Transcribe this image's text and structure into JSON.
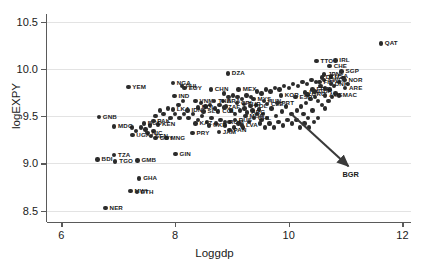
{
  "chart_data": {
    "type": "scatter",
    "title": "",
    "xlabel": "Loggdp",
    "ylabel": "logEXPY",
    "xlim": [
      5.75,
      12.15
    ],
    "ylim": [
      8.38,
      10.58
    ],
    "xticks": [
      "6",
      "8",
      "10",
      "12"
    ],
    "xtick_values": [
      6,
      8,
      10,
      12
    ],
    "yticks": [
      "8.5",
      "9.0",
      "9.5",
      "10.0",
      "10.5"
    ],
    "ytick_values": [
      8.5,
      9.0,
      9.5,
      10.0,
      10.5
    ],
    "grid": "horizontal",
    "legend": "none",
    "marker_color": "#2b2b2b",
    "grid_color": "#e3e3e3",
    "axis_color": "#5a5a5a",
    "annotation": {
      "label": "BGR",
      "arrow_from_x": 10.05,
      "arrow_from_y": 9.52,
      "arrow_to_x": 11.05,
      "arrow_to_y": 8.97
    },
    "points": [
      {
        "label": "QAT",
        "x": 11.62,
        "y": 10.27,
        "lpos": "right"
      },
      {
        "label": "TTO",
        "x": 10.49,
        "y": 10.08,
        "lpos": "right"
      },
      {
        "label": "IRL",
        "x": 10.82,
        "y": 10.09,
        "lpos": "right"
      },
      {
        "label": "CHE",
        "x": 10.72,
        "y": 10.03,
        "lpos": "right"
      },
      {
        "label": "SGP",
        "x": 10.93,
        "y": 9.97,
        "lpos": "right"
      },
      {
        "label": "DZA",
        "x": 8.93,
        "y": 9.95,
        "lpos": "right"
      },
      {
        "label": "NGA",
        "x": 7.96,
        "y": 9.85,
        "lpos": "right"
      },
      {
        "label": "YEM",
        "x": 7.18,
        "y": 9.81,
        "lpos": "right"
      },
      {
        "label": "JPN",
        "x": 10.62,
        "y": 9.94,
        "lpos": "right"
      },
      {
        "label": "USA",
        "x": 10.74,
        "y": 9.92,
        "lpos": "right"
      },
      {
        "label": "DEU",
        "x": 10.58,
        "y": 9.91,
        "lpos": "right"
      },
      {
        "label": "NOR",
        "x": 10.98,
        "y": 9.88,
        "lpos": "right"
      },
      {
        "label": "SWE",
        "x": 10.62,
        "y": 9.88,
        "lpos": "right"
      },
      {
        "label": "FIN",
        "x": 10.54,
        "y": 9.86,
        "lpos": "right"
      },
      {
        "label": "DNK",
        "x": 10.74,
        "y": 9.84,
        "lpos": "right"
      },
      {
        "label": "ARE",
        "x": 10.99,
        "y": 9.8,
        "lpos": "right"
      },
      {
        "label": "MAC",
        "x": 10.88,
        "y": 9.72,
        "lpos": "right"
      },
      {
        "label": "GRC",
        "x": 10.33,
        "y": 9.73,
        "lpos": "right"
      },
      {
        "label": "AUS",
        "x": 10.64,
        "y": 9.72,
        "lpos": "right"
      },
      {
        "label": "EGY",
        "x": 8.17,
        "y": 9.8,
        "lpos": "right"
      },
      {
        "label": "PHL",
        "x": 8.12,
        "y": 9.82,
        "lpos": "right"
      },
      {
        "label": "CHN",
        "x": 8.63,
        "y": 9.78,
        "lpos": "right"
      },
      {
        "label": "MEX",
        "x": 9.12,
        "y": 9.78,
        "lpos": "right"
      },
      {
        "label": "IND",
        "x": 7.99,
        "y": 9.71,
        "lpos": "right"
      },
      {
        "label": "VNM",
        "x": 8.36,
        "y": 9.66,
        "lpos": "right"
      },
      {
        "label": "BOL",
        "x": 8.4,
        "y": 9.59,
        "lpos": "right"
      },
      {
        "label": "BRA",
        "x": 8.84,
        "y": 9.66,
        "lpos": "right"
      },
      {
        "label": "THA",
        "x": 8.69,
        "y": 9.66,
        "lpos": "right"
      },
      {
        "label": "TUR",
        "x": 9.21,
        "y": 9.63,
        "lpos": "right"
      },
      {
        "label": "CRI",
        "x": 9.09,
        "y": 9.64,
        "lpos": "right"
      },
      {
        "label": "COL",
        "x": 8.76,
        "y": 9.55,
        "lpos": "right"
      },
      {
        "label": "ARG",
        "x": 9.27,
        "y": 9.54,
        "lpos": "right"
      },
      {
        "label": "MYS",
        "x": 9.38,
        "y": 9.68,
        "lpos": "right"
      },
      {
        "label": "ZAF",
        "x": 8.86,
        "y": 9.59,
        "lpos": "right"
      },
      {
        "label": "POL",
        "x": 9.33,
        "y": 9.61,
        "lpos": "right"
      },
      {
        "label": "HUN",
        "x": 9.56,
        "y": 9.66,
        "lpos": "right"
      },
      {
        "label": "CZE",
        "x": 9.62,
        "y": 9.63,
        "lpos": "right"
      },
      {
        "label": "KOR",
        "x": 9.86,
        "y": 9.72,
        "lpos": "right"
      },
      {
        "label": "ITA",
        "x": 10.29,
        "y": 9.75,
        "lpos": "right"
      },
      {
        "label": "FRA",
        "x": 10.42,
        "y": 9.78,
        "lpos": "right"
      },
      {
        "label": "GBR",
        "x": 10.45,
        "y": 9.76,
        "lpos": "right"
      },
      {
        "label": "ESP",
        "x": 10.12,
        "y": 9.7,
        "lpos": "right"
      },
      {
        "label": "PRT",
        "x": 9.8,
        "y": 9.64,
        "lpos": "right"
      },
      {
        "label": "CHL",
        "x": 9.39,
        "y": 9.48,
        "lpos": "right"
      },
      {
        "label": "MUS",
        "x": 9.24,
        "y": 9.5,
        "lpos": "right"
      },
      {
        "label": "LKA",
        "x": 7.96,
        "y": 9.57,
        "lpos": "right"
      },
      {
        "label": "IDN",
        "x": 8.22,
        "y": 9.56,
        "lpos": "right"
      },
      {
        "label": "SLV",
        "x": 8.5,
        "y": 9.55,
        "lpos": "right"
      },
      {
        "label": "KEN",
        "x": 7.7,
        "y": 9.41,
        "lpos": "right"
      },
      {
        "label": "BGD",
        "x": 7.45,
        "y": 9.42,
        "lpos": "right"
      },
      {
        "label": "PAK",
        "x": 7.62,
        "y": 9.45,
        "lpos": "right"
      },
      {
        "label": "KAZ",
        "x": 8.36,
        "y": 9.42,
        "lpos": "right"
      },
      {
        "label": "ROM",
        "x": 8.88,
        "y": 9.44,
        "lpos": "right"
      },
      {
        "label": "UKR",
        "x": 8.6,
        "y": 9.4,
        "lpos": "right"
      },
      {
        "label": "RUS",
        "x": 9.05,
        "y": 9.46,
        "lpos": "right"
      },
      {
        "label": "LVA",
        "x": 9.18,
        "y": 9.4,
        "lpos": "right"
      },
      {
        "label": "PAN",
        "x": 8.96,
        "y": 9.35,
        "lpos": "right"
      },
      {
        "label": "JAM",
        "x": 8.77,
        "y": 9.33,
        "lpos": "right"
      },
      {
        "label": "PRY",
        "x": 8.31,
        "y": 9.32,
        "lpos": "right"
      },
      {
        "label": "MNG",
        "x": 7.85,
        "y": 9.27,
        "lpos": "right"
      },
      {
        "label": "GUY",
        "x": 7.66,
        "y": 9.27,
        "lpos": "right"
      },
      {
        "label": "NIC",
        "x": 7.52,
        "y": 9.32,
        "lpos": "right"
      },
      {
        "label": "GNB",
        "x": 6.66,
        "y": 9.49,
        "lpos": "right"
      },
      {
        "label": "MDG",
        "x": 6.93,
        "y": 9.39,
        "lpos": "right"
      },
      {
        "label": "UGA",
        "x": 7.25,
        "y": 9.3,
        "lpos": "right"
      },
      {
        "label": "SEN",
        "x": 7.58,
        "y": 9.29,
        "lpos": "right"
      },
      {
        "label": "GIN",
        "x": 8.01,
        "y": 9.1,
        "lpos": "right"
      },
      {
        "label": "TZA",
        "x": 6.93,
        "y": 9.09,
        "lpos": "right"
      },
      {
        "label": "BDI",
        "x": 6.64,
        "y": 9.04,
        "lpos": "right"
      },
      {
        "label": "TGO",
        "x": 6.95,
        "y": 9.02,
        "lpos": "right"
      },
      {
        "label": "GMB",
        "x": 7.34,
        "y": 9.03,
        "lpos": "right"
      },
      {
        "label": "GHA",
        "x": 7.37,
        "y": 8.84,
        "lpos": "right"
      },
      {
        "label": "MWI",
        "x": 7.22,
        "y": 8.71,
        "lpos": "right"
      },
      {
        "label": "ETH",
        "x": 7.33,
        "y": 8.7,
        "lpos": "right"
      },
      {
        "label": "NER",
        "x": 6.78,
        "y": 8.53,
        "lpos": "right"
      }
    ],
    "extra_points": [
      {
        "x": 10.05,
        "y": 9.52
      },
      {
        "x": 10.15,
        "y": 9.56
      },
      {
        "x": 10.22,
        "y": 9.6
      },
      {
        "x": 10.3,
        "y": 9.64
      },
      {
        "x": 10.38,
        "y": 9.68
      },
      {
        "x": 10.46,
        "y": 9.7
      },
      {
        "x": 10.52,
        "y": 9.66
      },
      {
        "x": 10.58,
        "y": 9.62
      },
      {
        "x": 10.64,
        "y": 9.58
      },
      {
        "x": 10.7,
        "y": 9.66
      },
      {
        "x": 10.76,
        "y": 9.7
      },
      {
        "x": 10.82,
        "y": 9.74
      },
      {
        "x": 10.26,
        "y": 9.52
      },
      {
        "x": 10.34,
        "y": 9.48
      },
      {
        "x": 10.42,
        "y": 9.56
      },
      {
        "x": 9.95,
        "y": 9.6
      },
      {
        "x": 9.88,
        "y": 9.55
      },
      {
        "x": 9.78,
        "y": 9.5
      },
      {
        "x": 9.7,
        "y": 9.58
      },
      {
        "x": 9.62,
        "y": 9.48
      },
      {
        "x": 9.55,
        "y": 9.52
      },
      {
        "x": 9.48,
        "y": 9.57
      },
      {
        "x": 9.42,
        "y": 9.62
      },
      {
        "x": 9.34,
        "y": 9.7
      },
      {
        "x": 9.26,
        "y": 9.72
      },
      {
        "x": 9.18,
        "y": 9.68
      },
      {
        "x": 9.1,
        "y": 9.7
      },
      {
        "x": 9.02,
        "y": 9.72
      },
      {
        "x": 8.94,
        "y": 9.7
      },
      {
        "x": 8.86,
        "y": 9.74
      },
      {
        "x": 9.44,
        "y": 9.76
      },
      {
        "x": 9.52,
        "y": 9.74
      },
      {
        "x": 9.6,
        "y": 9.78
      },
      {
        "x": 9.68,
        "y": 9.76
      },
      {
        "x": 9.76,
        "y": 9.8
      },
      {
        "x": 9.84,
        "y": 9.78
      },
      {
        "x": 9.92,
        "y": 9.82
      },
      {
        "x": 10.0,
        "y": 9.8
      },
      {
        "x": 10.08,
        "y": 9.84
      },
      {
        "x": 10.16,
        "y": 9.82
      },
      {
        "x": 10.24,
        "y": 9.86
      },
      {
        "x": 10.32,
        "y": 9.84
      },
      {
        "x": 10.4,
        "y": 9.88
      },
      {
        "x": 10.48,
        "y": 9.86
      },
      {
        "x": 10.56,
        "y": 9.82
      },
      {
        "x": 10.64,
        "y": 9.8
      },
      {
        "x": 10.72,
        "y": 9.78
      },
      {
        "x": 10.8,
        "y": 9.82
      },
      {
        "x": 10.88,
        "y": 9.86
      },
      {
        "x": 10.96,
        "y": 9.9
      },
      {
        "x": 11.04,
        "y": 9.84
      },
      {
        "x": 9.3,
        "y": 9.44
      },
      {
        "x": 9.2,
        "y": 9.38
      },
      {
        "x": 9.12,
        "y": 9.42
      },
      {
        "x": 9.04,
        "y": 9.38
      },
      {
        "x": 8.96,
        "y": 9.44
      },
      {
        "x": 8.88,
        "y": 9.4
      },
      {
        "x": 8.8,
        "y": 9.46
      },
      {
        "x": 8.72,
        "y": 9.42
      },
      {
        "x": 8.64,
        "y": 9.48
      },
      {
        "x": 8.56,
        "y": 9.44
      },
      {
        "x": 8.48,
        "y": 9.5
      },
      {
        "x": 8.4,
        "y": 9.46
      },
      {
        "x": 8.32,
        "y": 9.52
      },
      {
        "x": 8.24,
        "y": 9.48
      },
      {
        "x": 8.16,
        "y": 9.52
      },
      {
        "x": 8.08,
        "y": 9.48
      },
      {
        "x": 8.0,
        "y": 9.52
      },
      {
        "x": 7.92,
        "y": 9.48
      },
      {
        "x": 9.5,
        "y": 9.42
      },
      {
        "x": 9.58,
        "y": 9.38
      },
      {
        "x": 9.66,
        "y": 9.42
      },
      {
        "x": 9.74,
        "y": 9.38
      },
      {
        "x": 9.82,
        "y": 9.44
      },
      {
        "x": 9.9,
        "y": 9.4
      },
      {
        "x": 9.98,
        "y": 9.46
      },
      {
        "x": 10.06,
        "y": 9.42
      },
      {
        "x": 10.14,
        "y": 9.46
      },
      {
        "x": 8.7,
        "y": 9.58
      },
      {
        "x": 8.62,
        "y": 9.62
      },
      {
        "x": 8.54,
        "y": 9.6
      },
      {
        "x": 8.46,
        "y": 9.64
      },
      {
        "x": 8.78,
        "y": 9.62
      },
      {
        "x": 8.9,
        "y": 9.6
      },
      {
        "x": 9.36,
        "y": 9.56
      },
      {
        "x": 9.44,
        "y": 9.52
      },
      {
        "x": 9.52,
        "y": 9.46
      },
      {
        "x": 10.2,
        "y": 9.38
      },
      {
        "x": 10.28,
        "y": 9.42
      },
      {
        "x": 10.36,
        "y": 9.38
      },
      {
        "x": 8.06,
        "y": 9.62
      },
      {
        "x": 8.14,
        "y": 9.66
      },
      {
        "x": 7.88,
        "y": 9.58
      },
      {
        "x": 7.8,
        "y": 9.52
      },
      {
        "x": 7.74,
        "y": 9.56
      },
      {
        "x": 7.66,
        "y": 9.5
      },
      {
        "x": 9.06,
        "y": 9.52
      },
      {
        "x": 9.14,
        "y": 9.56
      },
      {
        "x": 8.98,
        "y": 9.56
      },
      {
        "x": 9.22,
        "y": 9.58
      },
      {
        "x": 10.44,
        "y": 9.44
      },
      {
        "x": 10.52,
        "y": 9.48
      },
      {
        "x": 7.48,
        "y": 9.36
      },
      {
        "x": 7.4,
        "y": 9.38
      },
      {
        "x": 7.56,
        "y": 9.4
      },
      {
        "x": 7.32,
        "y": 9.34
      },
      {
        "x": 7.24,
        "y": 9.38
      },
      {
        "x": 7.62,
        "y": 9.34
      }
    ]
  }
}
